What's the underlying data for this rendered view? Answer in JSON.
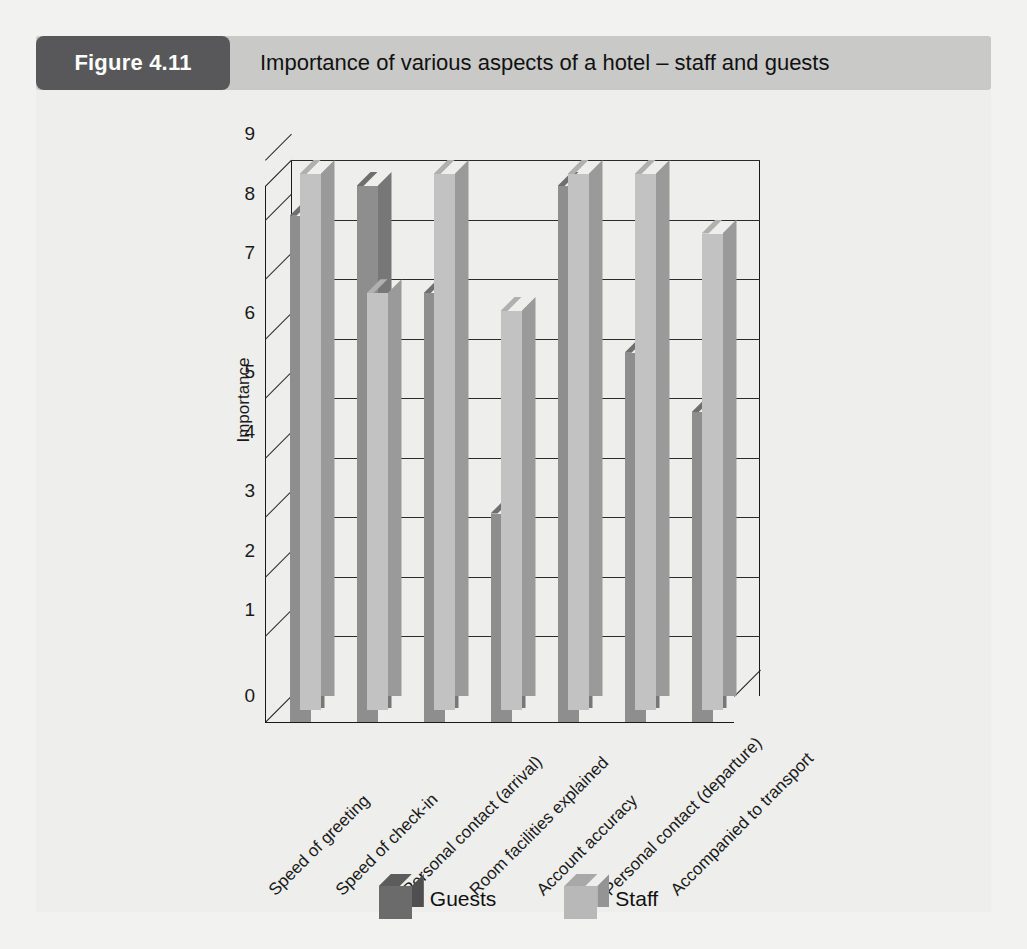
{
  "figure": {
    "tag": "Figure 4.11",
    "title": "Importance of various aspects of a hotel – staff and guests"
  },
  "chart_data": {
    "type": "bar",
    "title": "Importance of various aspects of a hotel – staff and guests",
    "xlabel": "",
    "ylabel": "Importance",
    "ylim": [
      0,
      9
    ],
    "yticks": [
      0,
      1,
      2,
      3,
      4,
      5,
      6,
      7,
      8,
      9
    ],
    "grid": true,
    "legend_position": "bottom",
    "style": "3d-column",
    "categories": [
      "Speed of greeting",
      "Speed of check-in",
      "Personal contact (arrival)",
      "Room facilities explained",
      "Account accuracy",
      "Personal contact (departure)",
      "Accompanied to transport"
    ],
    "series": [
      {
        "name": "Guests",
        "color": "#8e8e8e",
        "values": [
          8.5,
          9.0,
          7.2,
          3.5,
          9.0,
          6.2,
          5.2
        ]
      },
      {
        "name": "Staff",
        "color": "#c2c2c2",
        "values": [
          9.0,
          7.0,
          9.0,
          6.7,
          9.0,
          9.0,
          8.0
        ]
      }
    ]
  },
  "legend": {
    "items": [
      {
        "label": "Guests"
      },
      {
        "label": "Staff"
      }
    ]
  },
  "colors": {
    "header_bar": "#c9c9c7",
    "header_tag": "#58585a",
    "page_background": "#eeeeec",
    "guests": "#8e8e8e",
    "staff": "#c2c2c2",
    "axis": "#1a1a1a"
  }
}
